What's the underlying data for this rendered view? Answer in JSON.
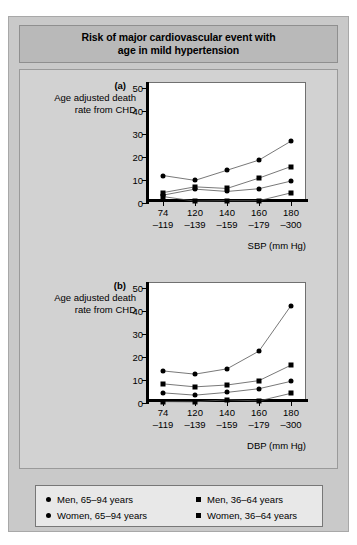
{
  "title": "Risk of major cardiovascular event with age in mild hypertension",
  "title_line1": "Risk of major cardiovascular event with",
  "title_line2": "age in mild hypertension",
  "ylabel_line1": "Age adjusted death",
  "ylabel_line2": "rate from CHD",
  "panel_a_tag": "(a)",
  "panel_b_tag": "(b)",
  "legend": {
    "men_old": "Men, 65–94 years",
    "men_young": "Men, 36–64 years",
    "women_old": "Women, 65–94 years",
    "women_young": "Women, 36–64 years"
  },
  "chart_data": [
    {
      "type": "line",
      "panel": "(a)",
      "title": "Risk of major cardiovascular event with age in mild hypertension",
      "xlabel": "SBP (mm Hg)",
      "ylabel": "Age adjusted death rate from CHD",
      "categories": [
        "74–119",
        "120–139",
        "140–159",
        "160–179",
        "180–300"
      ],
      "tick_top": [
        "74",
        "120",
        "140",
        "160",
        "180"
      ],
      "tick_bottom": [
        "–119",
        "–139",
        "–159",
        "–179",
        "–300"
      ],
      "yticks": [
        0,
        10,
        20,
        30,
        40,
        50
      ],
      "ylim": [
        0,
        52
      ],
      "grid": false,
      "legend_position": "bottom",
      "series": [
        {
          "name": "Men, 65–94 years",
          "marker": "circle",
          "values": [
            11.9,
            9.8,
            14.2,
            18.6,
            26.8
          ]
        },
        {
          "name": "Men, 36–64 years",
          "marker": "square",
          "values": [
            4.5,
            7.0,
            6.3,
            10.8,
            15.8
          ]
        },
        {
          "name": "Women, 65–94 years",
          "marker": "circle",
          "values": [
            3.4,
            6.0,
            5.0,
            6.2,
            9.5
          ]
        },
        {
          "name": "Women, 36–64 years",
          "marker": "square",
          "values": [
            2.8,
            0.8,
            1.0,
            1.0,
            4.4
          ]
        }
      ]
    },
    {
      "type": "line",
      "panel": "(b)",
      "title": "Risk of major cardiovascular event with age in mild hypertension",
      "xlabel": "DBP (mm Hg)",
      "ylabel": "Age adjusted death rate from CHD",
      "categories": [
        "74–119",
        "120–139",
        "140–159",
        "160–179",
        "180–300"
      ],
      "tick_top": [
        "74",
        "120",
        "140",
        "160",
        "180"
      ],
      "tick_bottom": [
        "–119",
        "–139",
        "–159",
        "–179",
        "–300"
      ],
      "yticks": [
        0,
        10,
        20,
        30,
        40,
        50
      ],
      "ylim": [
        0,
        52
      ],
      "grid": false,
      "legend_position": "bottom",
      "series": [
        {
          "name": "Men, 65–94 years",
          "marker": "circle",
          "values": [
            13.9,
            12.5,
            14.8,
            22.5,
            42.2
          ]
        },
        {
          "name": "Men, 36–64 years",
          "marker": "square",
          "values": [
            8.3,
            7.0,
            7.8,
            9.7,
            16.4
          ]
        },
        {
          "name": "Women, 65–94 years",
          "marker": "circle",
          "values": [
            4.4,
            3.4,
            4.6,
            6.2,
            9.4
          ]
        },
        {
          "name": "Women, 36–64 years",
          "marker": "square",
          "values": [
            0.6,
            0.5,
            1.4,
            0.9,
            4.2
          ]
        }
      ]
    }
  ]
}
